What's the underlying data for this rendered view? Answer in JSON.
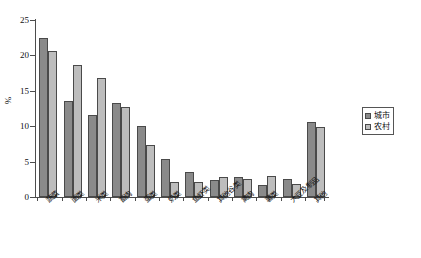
{
  "chart_data": {
    "type": "bar",
    "title": "",
    "xlabel": "",
    "ylabel": "%",
    "ylim": [
      0,
      25
    ],
    "yticks": [
      0,
      5,
      10,
      15,
      20,
      25
    ],
    "ytick_labels": [
      "0",
      "5",
      "10",
      "15",
      "20",
      "25"
    ],
    "grid": false,
    "legend_position": "right",
    "categories": [
      "蔬菜",
      "面类",
      "米类",
      "畜肉",
      "蛋类",
      "奶类",
      "鱼虾类",
      "其他谷类",
      "禽肉",
      "薯类",
      "大豆及制品",
      "其他"
    ],
    "series": [
      {
        "name": "城市",
        "color": "#8a8a8a",
        "values": [
          22.5,
          13.5,
          11.6,
          13.3,
          10.1,
          5.4,
          3.6,
          2.4,
          2.8,
          1.7,
          2.6,
          10.6
        ]
      },
      {
        "name": "农村",
        "color": "#bdbdbd",
        "values": [
          20.6,
          18.6,
          16.8,
          12.7,
          7.4,
          2.1,
          2.1,
          2.8,
          2.5,
          2.9,
          1.9,
          9.9
        ]
      }
    ]
  },
  "legend": {
    "items": [
      {
        "label": "城市",
        "swatch": "urban"
      },
      {
        "label": "农村",
        "swatch": "rural"
      }
    ]
  },
  "axis": {
    "y_title": "%"
  }
}
